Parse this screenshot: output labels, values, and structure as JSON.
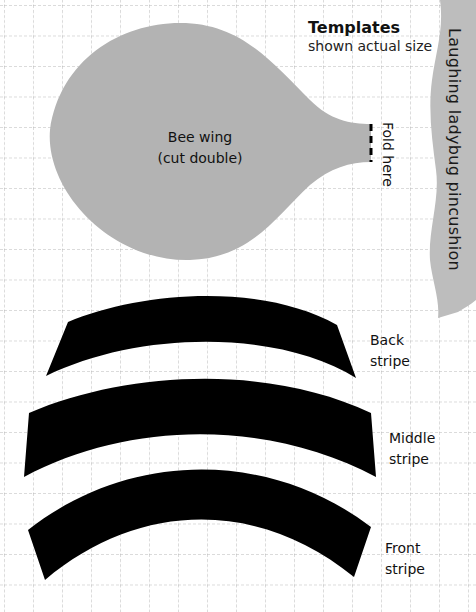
{
  "header": {
    "title": "Templates",
    "subtitle": "shown actual size"
  },
  "side_ribbon": {
    "text": "Laughing ladybug pincushion",
    "color": "#bdbdbd"
  },
  "wing_template": {
    "label_line1": "Bee wing",
    "label_line2": "(cut double)",
    "fold_label": "Fold here",
    "fill_color": "#b3b3b3"
  },
  "stripe_templates": [
    {
      "label_line1": "Back",
      "label_line2": "stripe"
    },
    {
      "label_line1": "Middle",
      "label_line2": "stripe"
    },
    {
      "label_line1": "Front",
      "label_line2": "stripe"
    }
  ],
  "colors": {
    "background": "#ffffff",
    "grid": "#b8b8b8",
    "stripe_fill": "#000000"
  }
}
